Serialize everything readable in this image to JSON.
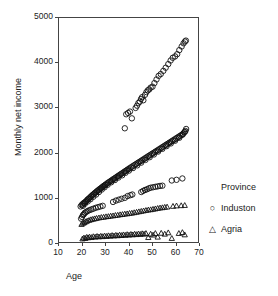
{
  "chart_data": {
    "type": "scatter",
    "title": "",
    "xlabel": "Age",
    "ylabel": "Monthly net income",
    "xlim": [
      10,
      70
    ],
    "ylim": [
      0,
      5000
    ],
    "xticks": [
      10,
      20,
      30,
      40,
      50,
      60,
      70
    ],
    "yticks": [
      0,
      1000,
      2000,
      3000,
      4000,
      5000
    ],
    "grid": false,
    "legend_position": "right",
    "legend_title": "Province",
    "legend_entries": [
      {
        "marker": "circle",
        "label": "Induston",
        "glyph": "○"
      },
      {
        "marker": "triangle",
        "label": "Agria",
        "glyph": "△"
      }
    ],
    "series": [
      {
        "name": "Induston upper",
        "marker": "circle",
        "points": [
          [
            38.0,
            2560
          ],
          [
            38.6,
            2870
          ],
          [
            39.4,
            2900
          ],
          [
            40.2,
            2930
          ],
          [
            41.0,
            2780
          ],
          [
            42.6,
            3010
          ],
          [
            43.2,
            3060
          ],
          [
            43.8,
            3120
          ],
          [
            44.4,
            3150
          ],
          [
            44.9,
            3210
          ],
          [
            45.4,
            3250
          ],
          [
            45.9,
            3180
          ],
          [
            46.6,
            3300
          ],
          [
            47.2,
            3360
          ],
          [
            47.8,
            3400
          ],
          [
            48.4,
            3420
          ],
          [
            49.0,
            3460
          ],
          [
            49.8,
            3480
          ],
          [
            50.6,
            3560
          ],
          [
            51.5,
            3640
          ],
          [
            52.4,
            3720
          ],
          [
            53.3,
            3760
          ],
          [
            54.4,
            3830
          ],
          [
            55.4,
            3900
          ],
          [
            56.5,
            3980
          ],
          [
            57.5,
            4060
          ],
          [
            58.4,
            4120
          ],
          [
            59.4,
            4150
          ],
          [
            60.3,
            4200
          ],
          [
            61.2,
            4290
          ],
          [
            62.2,
            4370
          ],
          [
            63.0,
            4440
          ],
          [
            63.6,
            4480
          ],
          [
            64.0,
            4500
          ]
        ]
      },
      {
        "name": "Induston main band",
        "marker": "circle",
        "points": [
          [
            19.2,
            830
          ],
          [
            19.6,
            860
          ],
          [
            20.0,
            880
          ],
          [
            20.4,
            900
          ],
          [
            20.8,
            915
          ],
          [
            21.2,
            930
          ],
          [
            21.6,
            950
          ],
          [
            22.0,
            975
          ],
          [
            22.4,
            995
          ],
          [
            22.8,
            1010
          ],
          [
            23.2,
            1030
          ],
          [
            23.6,
            1050
          ],
          [
            24.0,
            1070
          ],
          [
            24.4,
            1090
          ],
          [
            24.8,
            1105
          ],
          [
            25.2,
            1125
          ],
          [
            25.6,
            1140
          ],
          [
            26.0,
            1160
          ],
          [
            26.4,
            1175
          ],
          [
            26.8,
            1195
          ],
          [
            27.2,
            1210
          ],
          [
            27.6,
            1225
          ],
          [
            28.0,
            1240
          ],
          [
            28.4,
            1260
          ],
          [
            28.8,
            1275
          ],
          [
            29.2,
            1290
          ],
          [
            29.6,
            1305
          ],
          [
            30.0,
            1320
          ],
          [
            30.5,
            1340
          ],
          [
            31.0,
            1360
          ],
          [
            31.5,
            1375
          ],
          [
            32.0,
            1395
          ],
          [
            32.5,
            1410
          ],
          [
            33.0,
            1430
          ],
          [
            33.5,
            1445
          ],
          [
            34.0,
            1465
          ],
          [
            34.5,
            1480
          ],
          [
            35.0,
            1500
          ],
          [
            35.5,
            1515
          ],
          [
            36.0,
            1535
          ],
          [
            36.5,
            1550
          ],
          [
            37.0,
            1570
          ],
          [
            37.5,
            1585
          ],
          [
            38.0,
            1605
          ],
          [
            38.5,
            1620
          ],
          [
            39.0,
            1640
          ],
          [
            39.5,
            1655
          ],
          [
            40.0,
            1675
          ],
          [
            40.6,
            1695
          ],
          [
            41.2,
            1715
          ],
          [
            41.8,
            1735
          ],
          [
            42.4,
            1755
          ],
          [
            43.0,
            1775
          ],
          [
            43.6,
            1795
          ],
          [
            44.2,
            1815
          ],
          [
            44.8,
            1835
          ],
          [
            45.4,
            1855
          ],
          [
            46.0,
            1875
          ],
          [
            46.6,
            1895
          ],
          [
            47.2,
            1915
          ],
          [
            47.8,
            1935
          ],
          [
            48.4,
            1955
          ],
          [
            49.0,
            1975
          ],
          [
            49.6,
            1995
          ],
          [
            50.2,
            2015
          ],
          [
            50.8,
            2035
          ],
          [
            51.4,
            2055
          ],
          [
            52.0,
            2075
          ],
          [
            52.6,
            2095
          ],
          [
            53.2,
            2115
          ],
          [
            53.8,
            2135
          ],
          [
            54.4,
            2155
          ],
          [
            55.0,
            2175
          ],
          [
            55.6,
            2195
          ],
          [
            56.2,
            2215
          ],
          [
            56.8,
            2235
          ],
          [
            57.4,
            2255
          ],
          [
            58.0,
            2275
          ],
          [
            58.6,
            2295
          ],
          [
            59.2,
            2315
          ],
          [
            59.8,
            2335
          ],
          [
            60.4,
            2355
          ],
          [
            61.0,
            2375
          ],
          [
            61.6,
            2395
          ],
          [
            62.2,
            2415
          ],
          [
            62.8,
            2440
          ],
          [
            63.3,
            2470
          ],
          [
            63.8,
            2500
          ],
          [
            64.1,
            2545
          ],
          [
            20.2,
            845
          ],
          [
            21.0,
            890
          ],
          [
            22.2,
            940
          ],
          [
            23.4,
            990
          ],
          [
            24.6,
            1045
          ],
          [
            25.8,
            1095
          ],
          [
            27.0,
            1150
          ],
          [
            28.2,
            1205
          ],
          [
            29.4,
            1255
          ],
          [
            30.7,
            1310
          ],
          [
            32.2,
            1365
          ],
          [
            33.8,
            1415
          ],
          [
            35.3,
            1470
          ],
          [
            36.9,
            1520
          ],
          [
            38.3,
            1575
          ],
          [
            39.8,
            1625
          ],
          [
            41.5,
            1680
          ],
          [
            43.3,
            1740
          ],
          [
            45.0,
            1800
          ],
          [
            46.8,
            1860
          ],
          [
            48.6,
            1920
          ],
          [
            50.4,
            1980
          ],
          [
            52.2,
            2045
          ],
          [
            54.0,
            2105
          ],
          [
            55.8,
            2165
          ],
          [
            57.6,
            2225
          ],
          [
            59.4,
            2285
          ],
          [
            61.2,
            2350
          ],
          [
            62.6,
            2420
          ],
          [
            63.5,
            2480
          ]
        ]
      },
      {
        "name": "Induston lower band",
        "marker": "circle",
        "points": [
          [
            19.4,
            560
          ],
          [
            19.8,
            600
          ],
          [
            20.2,
            640
          ],
          [
            20.6,
            660
          ],
          [
            21.0,
            690
          ],
          [
            21.6,
            710
          ],
          [
            22.2,
            730
          ],
          [
            23.0,
            750
          ],
          [
            23.8,
            765
          ],
          [
            24.6,
            780
          ],
          [
            25.6,
            800
          ],
          [
            26.6,
            815
          ],
          [
            27.6,
            830
          ],
          [
            28.6,
            845
          ],
          [
            33.0,
            930
          ],
          [
            34.2,
            960
          ],
          [
            35.4,
            980
          ],
          [
            36.6,
            1000
          ],
          [
            38.0,
            1020
          ],
          [
            39.2,
            1060
          ],
          [
            40.4,
            1080
          ],
          [
            41.2,
            1095
          ],
          [
            45.0,
            1150
          ],
          [
            45.8,
            1175
          ],
          [
            46.6,
            1195
          ],
          [
            47.4,
            1210
          ],
          [
            48.2,
            1230
          ],
          [
            49.0,
            1245
          ],
          [
            50.0,
            1255
          ],
          [
            51.0,
            1265
          ],
          [
            52.0,
            1275
          ],
          [
            53.0,
            1285
          ],
          [
            54.0,
            1290
          ],
          [
            58.0,
            1405
          ],
          [
            60.0,
            1420
          ],
          [
            62.5,
            1450
          ]
        ]
      },
      {
        "name": "Agria upper band",
        "marker": "triangle",
        "points": [
          [
            19.6,
            430
          ],
          [
            20.2,
            455
          ],
          [
            20.8,
            470
          ],
          [
            21.4,
            490
          ],
          [
            22.0,
            505
          ],
          [
            22.8,
            520
          ],
          [
            23.6,
            535
          ],
          [
            24.4,
            545
          ],
          [
            25.2,
            555
          ],
          [
            26.0,
            565
          ],
          [
            27.0,
            575
          ],
          [
            28.0,
            585
          ],
          [
            29.0,
            590
          ],
          [
            30.0,
            600
          ],
          [
            31.0,
            605
          ],
          [
            32.0,
            615
          ],
          [
            33.0,
            620
          ],
          [
            34.0,
            630
          ],
          [
            35.0,
            635
          ],
          [
            36.0,
            645
          ],
          [
            37.0,
            650
          ],
          [
            38.0,
            660
          ],
          [
            39.0,
            665
          ],
          [
            40.0,
            675
          ],
          [
            41.0,
            680
          ],
          [
            42.0,
            690
          ],
          [
            43.0,
            700
          ],
          [
            44.0,
            710
          ],
          [
            45.0,
            720
          ],
          [
            46.0,
            730
          ],
          [
            47.0,
            740
          ],
          [
            48.0,
            750
          ],
          [
            49.0,
            755
          ],
          [
            50.0,
            765
          ],
          [
            51.0,
            775
          ],
          [
            52.0,
            785
          ],
          [
            53.0,
            795
          ],
          [
            54.0,
            800
          ],
          [
            55.0,
            810
          ],
          [
            56.0,
            815
          ],
          [
            58.5,
            830
          ],
          [
            60.0,
            840
          ],
          [
            62.0,
            845
          ],
          [
            63.5,
            850
          ]
        ]
      },
      {
        "name": "Agria low band",
        "marker": "triangle",
        "points": [
          [
            20.0,
            110
          ],
          [
            20.6,
            130
          ],
          [
            21.2,
            120
          ],
          [
            21.8,
            145
          ],
          [
            22.4,
            135
          ],
          [
            23.0,
            150
          ],
          [
            23.8,
            140
          ],
          [
            24.6,
            160
          ],
          [
            25.4,
            150
          ],
          [
            26.2,
            165
          ],
          [
            27.0,
            155
          ],
          [
            27.8,
            170
          ],
          [
            28.6,
            160
          ],
          [
            29.4,
            175
          ],
          [
            30.2,
            165
          ],
          [
            31.0,
            180
          ],
          [
            31.8,
            170
          ],
          [
            32.6,
            185
          ],
          [
            33.4,
            175
          ],
          [
            34.2,
            190
          ],
          [
            35.0,
            180
          ],
          [
            35.8,
            195
          ],
          [
            36.6,
            185
          ],
          [
            37.4,
            200
          ],
          [
            38.2,
            190
          ],
          [
            39.0,
            205
          ],
          [
            39.8,
            195
          ],
          [
            40.6,
            210
          ],
          [
            41.4,
            200
          ],
          [
            42.2,
            215
          ],
          [
            43.0,
            205
          ],
          [
            43.8,
            220
          ],
          [
            44.6,
            210
          ],
          [
            45.4,
            225
          ],
          [
            46.2,
            215
          ],
          [
            47.0,
            230
          ],
          [
            48.0,
            140
          ],
          [
            49.0,
            215
          ],
          [
            50.0,
            195
          ],
          [
            51.0,
            230
          ],
          [
            52.0,
            150
          ],
          [
            53.5,
            235
          ],
          [
            55.0,
            215
          ],
          [
            56.5,
            245
          ],
          [
            58.0,
            120
          ],
          [
            61.0,
            230
          ],
          [
            62.5,
            250
          ],
          [
            63.5,
            200
          ]
        ]
      }
    ]
  }
}
